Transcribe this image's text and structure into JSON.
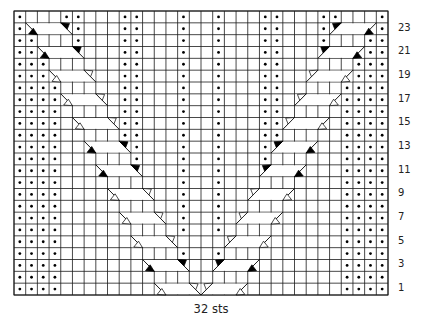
{
  "chart": {
    "stitches": 32,
    "rows": 24,
    "caption": "32 sts",
    "row_labels": [
      "1",
      "3",
      "5",
      "7",
      "9",
      "11",
      "13",
      "15",
      "17",
      "19",
      "21",
      "23"
    ],
    "grid_color": "#1a1a1a",
    "cable_fill": "#ffffff",
    "symmetric_mirror": true,
    "legend_symbols": {
      "dot": "purl",
      "blank": "knit",
      "cable_light": "cable cross over knit stitches (open triangle)",
      "cable_dark": "cable cross with purl stitch (solid triangle)"
    },
    "left_half_rows": [
      {
        "row": 1,
        "purls": [
          1,
          2,
          3,
          4
        ],
        "cable": {
          "start": 13,
          "shade": "light"
        }
      },
      {
        "row": 2,
        "purls": [
          1,
          2,
          3,
          4
        ]
      },
      {
        "row": 3,
        "purls": [
          1,
          2,
          3,
          4
        ],
        "cable": {
          "start": 12,
          "shade": "dark"
        }
      },
      {
        "row": 4,
        "purls": [
          1,
          2,
          3,
          4,
          15
        ]
      },
      {
        "row": 5,
        "purls": [
          1,
          2,
          3,
          4
        ],
        "cable": {
          "start": 11,
          "shade": "light"
        }
      },
      {
        "row": 6,
        "purls": [
          1,
          2,
          3,
          4,
          15
        ]
      },
      {
        "row": 7,
        "purls": [
          1,
          2,
          3,
          4,
          15
        ],
        "cable": {
          "start": 10,
          "shade": "light"
        }
      },
      {
        "row": 8,
        "purls": [
          1,
          2,
          3,
          4,
          15
        ]
      },
      {
        "row": 9,
        "purls": [
          1,
          2,
          3,
          4,
          15
        ],
        "cable": {
          "start": 9,
          "shade": "light"
        }
      },
      {
        "row": 10,
        "purls": [
          1,
          2,
          3,
          4,
          15
        ]
      },
      {
        "row": 11,
        "purls": [
          1,
          2,
          3,
          4,
          15
        ],
        "cable": {
          "start": 8,
          "shade": "dark"
        }
      },
      {
        "row": 12,
        "purls": [
          1,
          2,
          3,
          4,
          11,
          15
        ]
      },
      {
        "row": 13,
        "purls": [
          1,
          2,
          3,
          4,
          11,
          15
        ],
        "cable": {
          "start": 7,
          "shade": "dark"
        }
      },
      {
        "row": 14,
        "purls": [
          1,
          2,
          3,
          4,
          10,
          11,
          15
        ]
      },
      {
        "row": 15,
        "purls": [
          1,
          2,
          3,
          4,
          10,
          11,
          15
        ],
        "cable": {
          "start": 6,
          "shade": "light"
        }
      },
      {
        "row": 16,
        "purls": [
          1,
          2,
          3,
          4,
          10,
          11,
          15
        ]
      },
      {
        "row": 17,
        "purls": [
          1,
          2,
          3,
          4,
          10,
          11,
          15
        ],
        "cable": {
          "start": 5,
          "shade": "light"
        }
      },
      {
        "row": 18,
        "purls": [
          1,
          2,
          3,
          4,
          10,
          11,
          15
        ]
      },
      {
        "row": 19,
        "purls": [
          1,
          2,
          3,
          10,
          11,
          15
        ],
        "cable": {
          "start": 4,
          "shade": "light"
        }
      },
      {
        "row": 20,
        "purls": [
          1,
          2,
          3,
          10,
          11,
          15
        ]
      },
      {
        "row": 21,
        "purls": [
          1,
          2,
          10,
          11,
          15
        ],
        "cable": {
          "start": 3,
          "shade": "dark"
        }
      },
      {
        "row": 22,
        "purls": [
          1,
          2,
          6,
          10,
          11,
          15
        ]
      },
      {
        "row": 23,
        "purls": [
          1,
          6,
          10,
          11,
          15
        ],
        "cable": {
          "start": 2,
          "shade": "dark"
        }
      },
      {
        "row": 24,
        "purls": [
          1,
          5,
          6,
          10,
          11,
          15
        ]
      }
    ]
  }
}
